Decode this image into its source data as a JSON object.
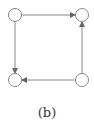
{
  "diagram": {
    "caption": "(b)",
    "nodes": [
      {
        "id": "tl",
        "x": 15,
        "y": 15
      },
      {
        "id": "tr",
        "x": 82,
        "y": 15
      },
      {
        "id": "bl",
        "x": 15,
        "y": 80
      },
      {
        "id": "br",
        "x": 82,
        "y": 80
      }
    ],
    "edges": [
      {
        "from": "tl",
        "to": "tr"
      },
      {
        "from": "tl",
        "to": "bl"
      },
      {
        "from": "br",
        "to": "bl"
      },
      {
        "from": "br",
        "to": "tr"
      }
    ],
    "colors": {
      "stroke": "#888888",
      "fill": "#ffffff"
    }
  }
}
